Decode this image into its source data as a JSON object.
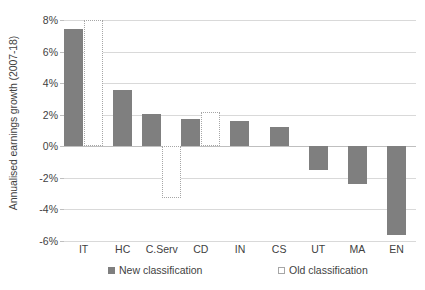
{
  "chart_data": {
    "type": "bar",
    "title": "",
    "xlabel": "",
    "ylabel": "Annualised earnings growth (2007-18)",
    "ylim": [
      -6,
      8
    ],
    "ytick_step": 2,
    "ytick_labels": [
      "8%",
      "6%",
      "4%",
      "2%",
      "0%",
      "-2%",
      "-4%",
      "-6%"
    ],
    "ytick_values": [
      8,
      6,
      4,
      2,
      0,
      -2,
      -4,
      -6
    ],
    "grid": true,
    "legend_position": "bottom",
    "categories": [
      "IT",
      "HC",
      "C.Serv",
      "CD",
      "IN",
      "CS",
      "UT",
      "MA",
      "EN"
    ],
    "series": [
      {
        "name": "New classification",
        "color": "#7f7f7f",
        "style": "solid",
        "values": [
          7.4,
          3.55,
          2.05,
          1.7,
          1.6,
          1.25,
          -1.5,
          -2.4,
          -5.6
        ]
      },
      {
        "name": "Old classification",
        "color": "#ffffff",
        "border_color": "#a6a6a6",
        "style": "dotted-outline",
        "values": [
          8.0,
          null,
          -3.3,
          2.2,
          null,
          null,
          null,
          null,
          null
        ]
      }
    ]
  },
  "legend": {
    "items": [
      {
        "label": "New classification",
        "swatch": "filled-gray-square"
      },
      {
        "label": "Old classification",
        "swatch": "outlined-white-square"
      }
    ]
  }
}
